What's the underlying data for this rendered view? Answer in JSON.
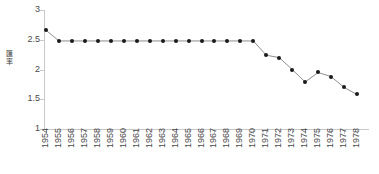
{
  "chart_data": {
    "type": "line",
    "title": "",
    "xlabel": "",
    "ylabel": "匯率",
    "ylabel_chars": [
      "匯",
      "率"
    ],
    "categories": [
      "1954",
      "1955",
      "1956",
      "1957",
      "1958",
      "1959",
      "1960",
      "1961",
      "1962",
      "1963",
      "1964",
      "1965",
      "1966",
      "1967",
      "1968",
      "1969",
      "1970",
      "1971",
      "1972",
      "1973",
      "1974",
      "1975",
      "1976",
      "1977",
      "1978"
    ],
    "values": [
      2.66,
      2.48,
      2.48,
      2.48,
      2.48,
      2.48,
      2.48,
      2.48,
      2.48,
      2.48,
      2.48,
      2.48,
      2.48,
      2.48,
      2.48,
      2.48,
      2.48,
      2.24,
      2.2,
      2.0,
      1.79,
      1.95,
      1.88,
      1.7,
      1.58
    ],
    "ylim": [
      1,
      3
    ],
    "yticks": [
      1,
      1.5,
      2,
      2.5,
      3
    ],
    "ytick_labels": [
      "1",
      "1.5",
      "2",
      "2.5",
      "3"
    ],
    "grid": false,
    "legend": null,
    "marker": "circle",
    "line_color": "#808080",
    "marker_color": "#1a1a1a",
    "axis_color": "#c9c9c9"
  }
}
